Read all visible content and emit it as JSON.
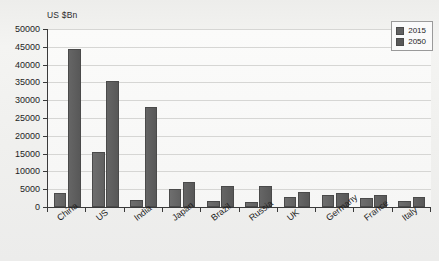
{
  "chart_data": {
    "type": "bar",
    "title": "",
    "subtitle": "",
    "xlabel": "",
    "ylabel": "US $Bn",
    "ylim": [
      0,
      50000
    ],
    "ytick_step": 5000,
    "yticks": [
      0,
      5000,
      10000,
      15000,
      20000,
      25000,
      30000,
      35000,
      40000,
      45000,
      50000
    ],
    "ytick_labels": [
      "0",
      "5000",
      "10000",
      "15000",
      "20000",
      "25000",
      "30000",
      "35000",
      "40000",
      "45000",
      "50000"
    ],
    "grid": true,
    "grid_axis": "y",
    "legend_position": "top-right",
    "categories": [
      "China",
      "US",
      "India",
      "Japan",
      "Brazil",
      "Russia",
      "UK",
      "Germany",
      "France",
      "Italy"
    ],
    "series": [
      {
        "name": "2015",
        "color": "#616161",
        "values": [
          4000,
          15500,
          2000,
          5000,
          1800,
          1400,
          2800,
          3400,
          2500,
          1800
        ]
      },
      {
        "name": "2050",
        "color": "#585858",
        "values": [
          44500,
          35500,
          28000,
          7000,
          6000,
          6000,
          4200,
          4000,
          3500,
          2800
        ]
      }
    ]
  },
  "legend": {
    "entries": [
      {
        "label": "2015",
        "swatch": "legend-swatch-2015"
      },
      {
        "label": "2050",
        "swatch": "legend-swatch-2050"
      }
    ]
  },
  "axis": {
    "unit_label": "US $Bn"
  }
}
